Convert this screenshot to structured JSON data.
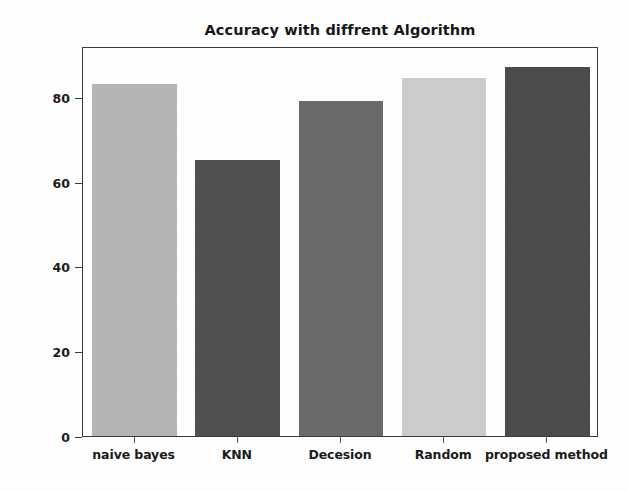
{
  "chart_data": {
    "type": "bar",
    "title": "Accuracy with diffrent Algorithm",
    "xlabel": "",
    "ylabel": "Accuracy",
    "categories": [
      "naive bayes",
      "KNN",
      "Decesion",
      "Random",
      "proposed method"
    ],
    "values": [
      83,
      65,
      79,
      84.5,
      87
    ],
    "bar_colors": [
      "#b5b5b5",
      "#505050",
      "#6a6a6a",
      "#cdcdcd",
      "#4c4c4c"
    ],
    "ylim": [
      0,
      92
    ],
    "xlim": [
      0,
      5
    ],
    "yticks": [
      0,
      20,
      40,
      60,
      80
    ],
    "ytick_labels": [
      "0",
      "20",
      "40",
      "60",
      "80"
    ],
    "grid": false,
    "legend": null,
    "axis_color": "#3a3a3a",
    "background": "#ffffff"
  },
  "figure": {
    "title_text": "Accuracy with diffrent Algorithm",
    "y_axis_title": "Accuracy"
  }
}
